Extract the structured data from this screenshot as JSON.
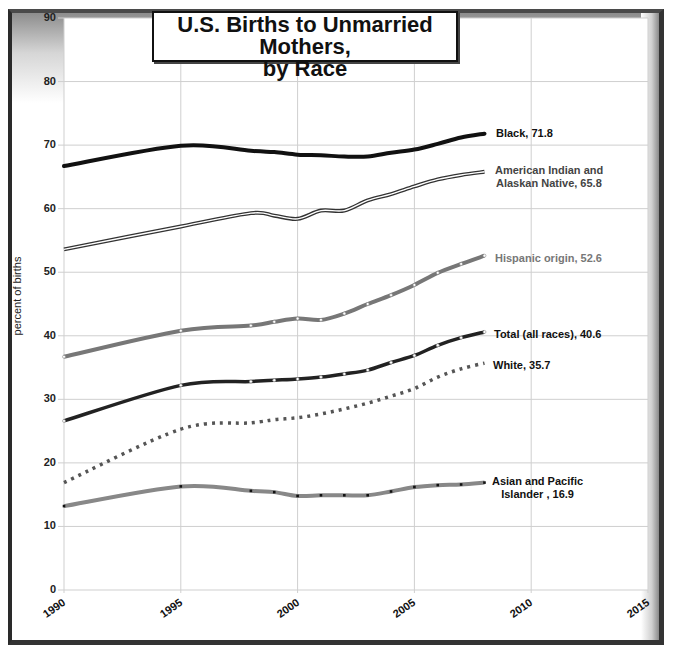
{
  "chart_data": {
    "type": "line",
    "title": "U.S. Births to Unmarried Mothers, by Race",
    "title_lines": [
      "U.S. Births to Unmarried Mothers,",
      "by Race"
    ],
    "xlabel": "",
    "ylabel": "percent of births",
    "xlim": [
      1990,
      2015
    ],
    "ylim": [
      0,
      90
    ],
    "x_ticks": [
      "1990",
      "1995",
      "2000",
      "2005",
      "2010",
      "2015"
    ],
    "y_ticks": [
      "0",
      "10",
      "20",
      "30",
      "40",
      "50",
      "60",
      "70",
      "80",
      "90"
    ],
    "grid": true,
    "legend_position": "inline-end-labels",
    "x": [
      1990,
      1995,
      1998,
      1999,
      2000,
      2001,
      2002,
      2003,
      2004,
      2005,
      2006,
      2007,
      2008
    ],
    "series": [
      {
        "name": "Black",
        "end_label": "Black, 71.8",
        "color": "#111111",
        "style": "solid-thick",
        "values": [
          66.7,
          69.9,
          69.1,
          68.9,
          68.5,
          68.4,
          68.2,
          68.2,
          68.8,
          69.3,
          70.2,
          71.2,
          71.8
        ]
      },
      {
        "name": "American Indian and Alaskan Native",
        "end_label": "American Indian and Alaskan Native, 65.8",
        "color": "#444444",
        "style": "double-line",
        "values": [
          53.6,
          57.2,
          59.3,
          58.9,
          58.4,
          59.7,
          59.7,
          61.3,
          62.3,
          63.5,
          64.6,
          65.3,
          65.8
        ]
      },
      {
        "name": "Hispanic origin",
        "end_label": "Hispanic origin, 52.6",
        "color": "#777777",
        "style": "solid-gray",
        "values": [
          36.7,
          40.8,
          41.6,
          42.2,
          42.7,
          42.5,
          43.5,
          45.0,
          46.4,
          48.0,
          49.9,
          51.3,
          52.6
        ]
      },
      {
        "name": "Total (all races)",
        "end_label": "Total (all races), 40.6",
        "color": "#222222",
        "style": "solid-dark",
        "values": [
          26.6,
          32.2,
          32.8,
          33.0,
          33.2,
          33.5,
          34.0,
          34.6,
          35.8,
          36.9,
          38.5,
          39.7,
          40.6
        ]
      },
      {
        "name": "White",
        "end_label": "White, 35.7",
        "color": "#555555",
        "style": "dotted",
        "values": [
          16.9,
          25.3,
          26.3,
          26.8,
          27.1,
          27.7,
          28.5,
          29.4,
          30.5,
          31.7,
          33.5,
          34.8,
          35.7
        ]
      },
      {
        "name": "Asian and Pacific Islander",
        "end_label": "Asian and Pacific Islander , 16.9",
        "color": "#888888",
        "style": "solid-gray-markers",
        "values": [
          13.2,
          16.3,
          15.6,
          15.4,
          14.8,
          14.9,
          14.9,
          14.9,
          15.5,
          16.2,
          16.5,
          16.6,
          16.9
        ]
      }
    ]
  },
  "labels": {
    "black": "Black, 71.8",
    "aian_1": "American Indian and",
    "aian_2": "Alaskan Native, 65.8",
    "hispanic": "Hispanic origin, 52.6",
    "total": "Total (all races), 40.6",
    "white": "White, 35.7",
    "api_1": "Asian and Pacific",
    "api_2": "Islander , 16.9"
  }
}
